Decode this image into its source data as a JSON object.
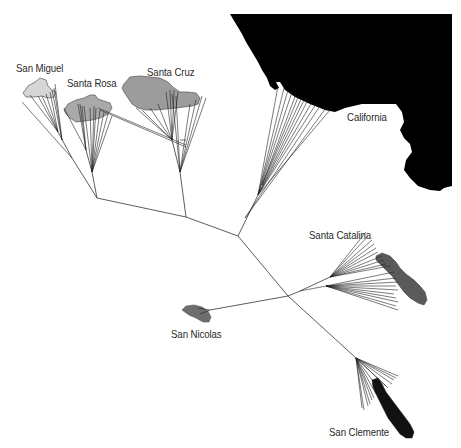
{
  "figure": {
    "type": "unrooted phylogenetic tree over map",
    "colors": {
      "mainland": "#000000",
      "san_miguel": "#d4d4d4",
      "santa_rosa": "#a8a8a8",
      "santa_cruz": "#9c9c9c",
      "santa_catalina": "#5a5a5a",
      "san_nicolas": "#6e6e6e",
      "san_clemente": "#111111",
      "branch": "#333333",
      "background": "#ffffff"
    }
  },
  "labels": {
    "san_miguel": "San Miguel",
    "santa_rosa": "Santa Rosa",
    "santa_cruz": "Santa Cruz",
    "california": "California",
    "santa_catalina": "Santa Catalina",
    "san_nicolas": "San Nicolas",
    "san_clemente": "San Clemente"
  }
}
